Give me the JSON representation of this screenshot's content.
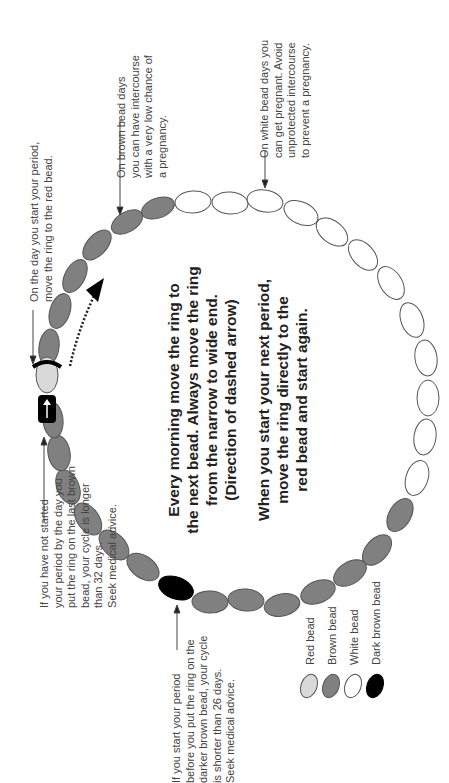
{
  "diagram": {
    "orientation": "rotated 90 degrees counter-clockwise",
    "colors": {
      "red_bead": "#d9d9d9",
      "brown_bead": "#808080",
      "white_bead": "#ffffff",
      "dark_brown_bead": "#000000",
      "outline": "#444444",
      "ring_marker": "#000000"
    },
    "annotations": {
      "red_bead_note": "On the day you start your period,\nmove the ring to the red bead.",
      "brown_bead_note": "On brown bead days\nyou can have intercourse\nwith a very low chance of\na pregnancy.",
      "white_bead_note": "On white bead days you\ncan get pregnant. Avoid\nunprotected intercourse\nto prevent a pregnancy.",
      "long_cycle_note": "If you have not started\nyour period by the day you\nput the ring on the last brown\nbead, your cycle is longer\nthan 32 days.\nSeek medical advice.",
      "short_cycle_note": "If you start your period\nbefore you put the ring on the\ndarker brown bead, your cycle\nis shorter than 26 days.\nSeek medical advice."
    },
    "center_text": {
      "instruction_1": "Every morning move the ring to\nthe next bead. Always move the ring\nfrom the narrow to wide end.\n(Direction of dashed arrow)",
      "instruction_2": "When you start your next period,\nmove the ring directly to the\nred bead and start again."
    },
    "legend": {
      "items": [
        {
          "label": "Red bead",
          "type": "red"
        },
        {
          "label": "Brown bead",
          "type": "brown"
        },
        {
          "label": "White bead",
          "type": "white"
        },
        {
          "label": "Dark brown bead",
          "type": "dark"
        }
      ]
    },
    "bead_sequence": {
      "red": 1,
      "brown_after_red": 6,
      "white": 12,
      "brown_after_white": 13,
      "dark_brown_position": "between brown beads on lower left",
      "total_beads": 32
    }
  }
}
